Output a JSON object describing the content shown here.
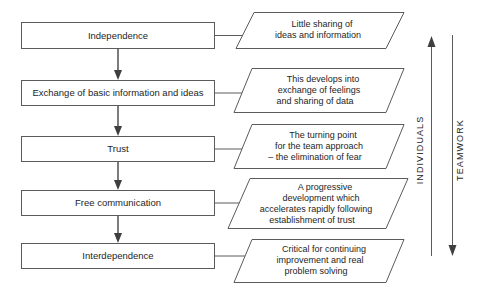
{
  "diagram": {
    "type": "flowchart",
    "colors": {
      "background": "#ffffff",
      "stroke": "#5b5b5b",
      "text": "#1e1e1e",
      "arrow": "#3f3f3f"
    },
    "stages": [
      {
        "label": "Independence"
      },
      {
        "label": "Exchange of basic information and ideas"
      },
      {
        "label": "Trust"
      },
      {
        "label": "Free communication"
      },
      {
        "label": "Interdependence"
      }
    ],
    "callouts": [
      {
        "lines": [
          "Little sharing of",
          "ideas and information"
        ]
      },
      {
        "lines": [
          "This develops into",
          "exchange of feelings",
          "and sharing of data"
        ]
      },
      {
        "lines": [
          "The turning point",
          "for the team approach",
          "– the elimination of fear"
        ]
      },
      {
        "lines": [
          "A progressive",
          "development which",
          "accelerates rapidly following",
          "establishment of trust"
        ]
      },
      {
        "lines": [
          "Critical for continuing",
          "improvement and real",
          "problem solving"
        ]
      }
    ],
    "axes": [
      {
        "label": "INDIVIDUALS",
        "direction": "up"
      },
      {
        "label": "TEAMWORK",
        "direction": "down"
      }
    ]
  }
}
